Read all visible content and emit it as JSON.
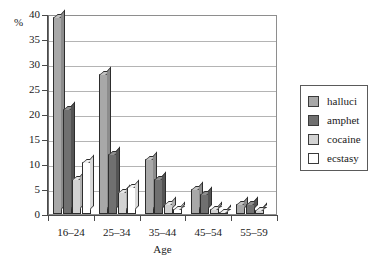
{
  "chart_data": {
    "type": "bar",
    "title": "",
    "xlabel": "Age",
    "ylabel": "%",
    "ylim": [
      0,
      40
    ],
    "yticks": [
      0,
      5,
      10,
      15,
      20,
      25,
      30,
      35,
      40
    ],
    "ytick_labels": [
      "0",
      "5",
      "10",
      "15",
      "20",
      "25",
      "30",
      "35",
      "40"
    ],
    "grid": true,
    "legend_position": "right-outside",
    "categories": [
      "16–24",
      "25–34",
      "35–44",
      "45–54",
      "55–59"
    ],
    "series": [
      {
        "name": "halluci",
        "color": "#a8a8a8",
        "values": [
          39.5,
          28,
          11,
          5,
          2
        ]
      },
      {
        "name": "amphet",
        "color": "#707070",
        "values": [
          21,
          12,
          7,
          4,
          2
        ]
      },
      {
        "name": "cocaine",
        "color": "#d2d2d2",
        "values": [
          7,
          4.5,
          2,
          1,
          0.8
        ]
      },
      {
        "name": "ecstasy",
        "color": "#ffffff",
        "values": [
          10.5,
          5.5,
          1,
          0.5,
          0
        ]
      }
    ]
  },
  "legend": {
    "items": [
      {
        "label": "halluci"
      },
      {
        "label": "amphet"
      },
      {
        "label": "cocaine"
      },
      {
        "label": "ecstasy"
      }
    ]
  }
}
